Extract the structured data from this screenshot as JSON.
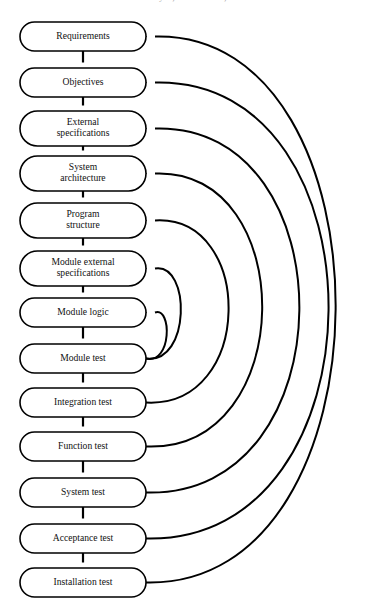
{
  "header": {
    "running_text": "220  SOFTWARE ENGINEERING: Analysis, Construction, and Maintenance"
  },
  "diagram": {
    "orientation": "vertical-top-down",
    "colors": {
      "stroke": "#000000",
      "fill": "#ffffff",
      "text": "#111111"
    },
    "nodes": [
      {
        "id": "requirements",
        "label": "Requirements",
        "lines": [
          "Requirements"
        ],
        "x": 20,
        "y": 22,
        "w": 126,
        "h": 29
      },
      {
        "id": "objectives",
        "label": "Objectives",
        "lines": [
          "Objectives"
        ],
        "x": 20,
        "y": 68,
        "w": 126,
        "h": 29
      },
      {
        "id": "external-specifications",
        "label": "External specifications",
        "lines": [
          "External",
          "specifications"
        ],
        "x": 20,
        "y": 111,
        "w": 126,
        "h": 35
      },
      {
        "id": "system-architecture",
        "label": "System architecture",
        "lines": [
          "System",
          "architecture"
        ],
        "x": 20,
        "y": 156,
        "w": 126,
        "h": 35
      },
      {
        "id": "program-structure",
        "label": "Program structure",
        "lines": [
          "Program",
          "structure"
        ],
        "x": 20,
        "y": 203,
        "w": 126,
        "h": 35
      },
      {
        "id": "module-external-specifications",
        "label": "Module external specifications",
        "lines": [
          "Module external",
          "specifications"
        ],
        "x": 20,
        "y": 251,
        "w": 126,
        "h": 35
      },
      {
        "id": "module-logic",
        "label": "Module logic",
        "lines": [
          "Module logic"
        ],
        "x": 20,
        "y": 298,
        "w": 126,
        "h": 29
      },
      {
        "id": "module-test",
        "label": "Module test",
        "lines": [
          "Module test"
        ],
        "x": 20,
        "y": 344,
        "w": 126,
        "h": 29
      },
      {
        "id": "integration-test",
        "label": "Integration test",
        "lines": [
          "Integration test"
        ],
        "x": 20,
        "y": 388,
        "w": 126,
        "h": 29
      },
      {
        "id": "function-test",
        "label": "Function test",
        "lines": [
          "Function test"
        ],
        "x": 20,
        "y": 432,
        "w": 126,
        "h": 29
      },
      {
        "id": "system-test",
        "label": "System test",
        "lines": [
          "System test"
        ],
        "x": 20,
        "y": 478,
        "w": 126,
        "h": 29
      },
      {
        "id": "acceptance-test",
        "label": "Acceptance test",
        "lines": [
          "Acceptance test"
        ],
        "x": 20,
        "y": 524,
        "w": 126,
        "h": 29
      },
      {
        "id": "installation-test",
        "label": "Installation test",
        "lines": [
          "Installation test"
        ],
        "x": 20,
        "y": 568,
        "w": 126,
        "h": 29
      }
    ],
    "sequence_arrows": [
      {
        "from": "requirements",
        "to": "objectives"
      },
      {
        "from": "objectives",
        "to": "external-specifications"
      },
      {
        "from": "external-specifications",
        "to": "system-architecture"
      },
      {
        "from": "system-architecture",
        "to": "program-structure"
      },
      {
        "from": "program-structure",
        "to": "module-external-specifications"
      },
      {
        "from": "module-external-specifications",
        "to": "module-logic"
      },
      {
        "from": "module-logic",
        "to": "module-test"
      },
      {
        "from": "module-test",
        "to": "integration-test"
      },
      {
        "from": "integration-test",
        "to": "function-test"
      },
      {
        "from": "function-test",
        "to": "system-test"
      },
      {
        "from": "system-test",
        "to": "acceptance-test"
      },
      {
        "from": "acceptance-test",
        "to": "installation-test"
      }
    ],
    "feedback_arcs": [
      {
        "from": "module-test",
        "to": "module-logic",
        "bulge": 22
      },
      {
        "from": "module-test",
        "to": "module-external-specifications",
        "bulge": 38
      },
      {
        "from": "integration-test",
        "to": "program-structure",
        "bulge": 92
      },
      {
        "from": "function-test",
        "to": "system-architecture",
        "bulge": 130
      },
      {
        "from": "system-test",
        "to": "external-specifications",
        "bulge": 172
      },
      {
        "from": "acceptance-test",
        "to": "objectives",
        "bulge": 205
      },
      {
        "from": "installation-test",
        "to": "requirements",
        "bulge": 213
      }
    ]
  }
}
